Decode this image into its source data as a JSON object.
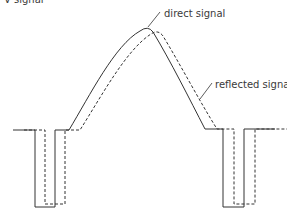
{
  "axis": {
    "y_label": "V signal"
  },
  "labels": {
    "direct": "direct signal",
    "reflected": "reflected signal"
  },
  "colors": {
    "line": "#333333",
    "text": "#3a3a3a"
  }
}
